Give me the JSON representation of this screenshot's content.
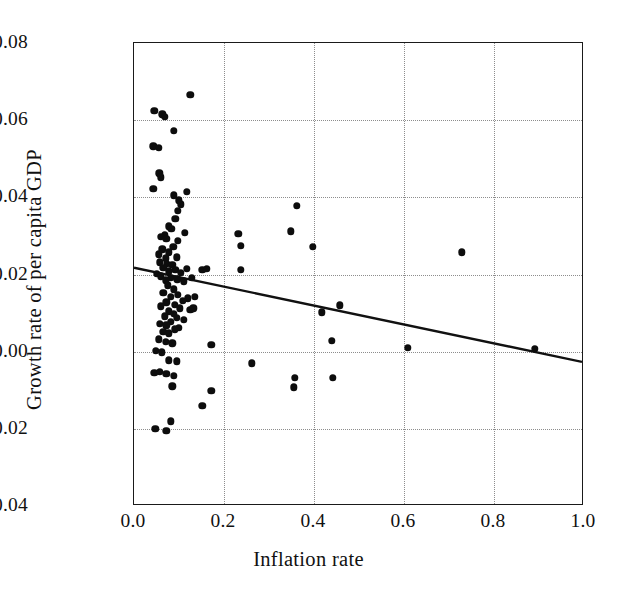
{
  "chart_data": {
    "type": "scatter",
    "title": "",
    "xlabel": "Inflation rate",
    "ylabel": "Growth rate of per capita GDP",
    "xlim": [
      0.0,
      1.0
    ],
    "ylim": [
      -0.04,
      0.08
    ],
    "xticks": [
      "0.0",
      "0.2",
      "0.4",
      "0.6",
      "0.8",
      "1.0"
    ],
    "xtick_values": [
      0.0,
      0.2,
      0.4,
      0.6,
      0.8,
      1.0
    ],
    "yticks": [
      "0.08",
      "0.06",
      "0.04",
      "0.02",
      "0.00",
      "−0.02",
      "−0.04"
    ],
    "ytick_values": [
      0.08,
      0.06,
      0.04,
      0.02,
      0.0,
      -0.02,
      -0.04
    ],
    "grid": true,
    "grid_style": "dotted",
    "legend": "none",
    "marker": {
      "shape": "circle",
      "filled": true,
      "color": "#0d0d0d",
      "size_px": 7.4
    },
    "series": [
      {
        "name": "Countries",
        "points": [
          [
            0.125,
            0.0665
          ],
          [
            0.045,
            0.0625
          ],
          [
            0.063,
            0.0615
          ],
          [
            0.068,
            0.0608
          ],
          [
            0.088,
            0.0572
          ],
          [
            0.043,
            0.0532
          ],
          [
            0.055,
            0.0528
          ],
          [
            0.056,
            0.0462
          ],
          [
            0.06,
            0.0452
          ],
          [
            0.043,
            0.0422
          ],
          [
            0.088,
            0.0405
          ],
          [
            0.118,
            0.0415
          ],
          [
            0.099,
            0.0392
          ],
          [
            0.104,
            0.0382
          ],
          [
            0.098,
            0.0365
          ],
          [
            0.362,
            0.0378
          ],
          [
            0.092,
            0.0345
          ],
          [
            0.077,
            0.0325
          ],
          [
            0.083,
            0.0318
          ],
          [
            0.113,
            0.0308
          ],
          [
            0.068,
            0.0302
          ],
          [
            0.06,
            0.0298
          ],
          [
            0.072,
            0.0292
          ],
          [
            0.098,
            0.0288
          ],
          [
            0.087,
            0.0272
          ],
          [
            0.232,
            0.0305
          ],
          [
            0.348,
            0.0312
          ],
          [
            0.063,
            0.0265
          ],
          [
            0.078,
            0.0258
          ],
          [
            0.055,
            0.0252
          ],
          [
            0.095,
            0.0245
          ],
          [
            0.07,
            0.0242
          ],
          [
            0.237,
            0.0275
          ],
          [
            0.398,
            0.0272
          ],
          [
            0.728,
            0.0258
          ],
          [
            0.058,
            0.0232
          ],
          [
            0.073,
            0.0228
          ],
          [
            0.085,
            0.0225
          ],
          [
            0.065,
            0.0218
          ],
          [
            0.092,
            0.0212
          ],
          [
            0.078,
            0.0208
          ],
          [
            0.05,
            0.0202
          ],
          [
            0.104,
            0.0205
          ],
          [
            0.118,
            0.0215
          ],
          [
            0.152,
            0.0212
          ],
          [
            0.162,
            0.0215
          ],
          [
            0.238,
            0.0212
          ],
          [
            0.06,
            0.0195
          ],
          [
            0.082,
            0.0192
          ],
          [
            0.096,
            0.0188
          ],
          [
            0.07,
            0.0185
          ],
          [
            0.11,
            0.0182
          ],
          [
            0.128,
            0.0192
          ],
          [
            0.075,
            0.0172
          ],
          [
            0.088,
            0.0162
          ],
          [
            0.065,
            0.0152
          ],
          [
            0.098,
            0.0148
          ],
          [
            0.082,
            0.0142
          ],
          [
            0.12,
            0.0138
          ],
          [
            0.135,
            0.0142
          ],
          [
            0.108,
            0.0132
          ],
          [
            0.072,
            0.0128
          ],
          [
            0.09,
            0.0122
          ],
          [
            0.06,
            0.0118
          ],
          [
            0.102,
            0.0112
          ],
          [
            0.125,
            0.0108
          ],
          [
            0.132,
            0.0112
          ],
          [
            0.078,
            0.0105
          ],
          [
            0.088,
            0.0098
          ],
          [
            0.068,
            0.0092
          ],
          [
            0.095,
            0.0088
          ],
          [
            0.11,
            0.0082
          ],
          [
            0.082,
            0.0078
          ],
          [
            0.058,
            0.0072
          ],
          [
            0.072,
            0.0068
          ],
          [
            0.1,
            0.0062
          ],
          [
            0.09,
            0.0058
          ],
          [
            0.065,
            0.0052
          ],
          [
            0.078,
            0.0048
          ],
          [
            0.458,
            0.012
          ],
          [
            0.418,
            0.0102
          ],
          [
            0.055,
            0.0032
          ],
          [
            0.07,
            0.0025
          ],
          [
            0.085,
            0.0022
          ],
          [
            0.172,
            0.0018
          ],
          [
            0.44,
            0.0028
          ],
          [
            0.048,
            0.0002
          ],
          [
            0.062,
            -0.0002
          ],
          [
            0.608,
            0.001
          ],
          [
            0.89,
            0.0008
          ],
          [
            0.078,
            -0.0022
          ],
          [
            0.095,
            -0.0025
          ],
          [
            0.262,
            -0.003
          ],
          [
            0.045,
            -0.0055
          ],
          [
            0.058,
            -0.0052
          ],
          [
            0.072,
            -0.0058
          ],
          [
            0.088,
            -0.0062
          ],
          [
            0.358,
            -0.0068
          ],
          [
            0.442,
            -0.0068
          ],
          [
            0.085,
            -0.009
          ],
          [
            0.355,
            -0.0092
          ],
          [
            0.172,
            -0.0102
          ],
          [
            0.152,
            -0.014
          ],
          [
            0.082,
            -0.018
          ],
          [
            0.047,
            -0.02
          ],
          [
            0.072,
            -0.0205
          ]
        ]
      }
    ],
    "trendline": {
      "type": "linear-fit",
      "x_start": 0.0,
      "y_start": 0.0215,
      "x_end": 1.0,
      "y_end": -0.003,
      "color": "#111111",
      "width_px": 2.4
    }
  }
}
